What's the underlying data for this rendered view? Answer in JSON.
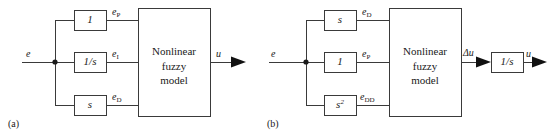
{
  "figure": {
    "background": "#ffffff",
    "line_color": "#3a3a3a",
    "text_color": "#1a1a1a"
  },
  "panels": [
    {
      "id": "a",
      "caption": "(a)",
      "input_label": "e",
      "output_label": "u",
      "main_block": {
        "line1": "Nonlinear",
        "line2": "fuzzy",
        "line3": "model"
      },
      "branches": [
        {
          "gain": "1",
          "gain_sup": "",
          "signal_base": "e",
          "signal_sub": "P"
        },
        {
          "gain": "1/s",
          "gain_sup": "",
          "signal_base": "e",
          "signal_sub": "I"
        },
        {
          "gain": "s",
          "gain_sup": "",
          "signal_base": "e",
          "signal_sub": "D"
        }
      ],
      "post_block": null
    },
    {
      "id": "b",
      "caption": "(b)",
      "input_label": "e",
      "output_label": "u",
      "main_block": {
        "line1": "Nonlinear",
        "line2": "fuzzy",
        "line3": "model"
      },
      "branches": [
        {
          "gain": "s",
          "gain_sup": "",
          "signal_base": "e",
          "signal_sub": "D"
        },
        {
          "gain": "1",
          "gain_sup": "",
          "signal_base": "e",
          "signal_sub": "P"
        },
        {
          "gain": "s",
          "gain_sup": "2",
          "signal_base": "e",
          "signal_sub": "DD"
        }
      ],
      "post_block": {
        "intermediate_label": "Δu",
        "gain": "1/s",
        "output_label": "u"
      }
    }
  ]
}
